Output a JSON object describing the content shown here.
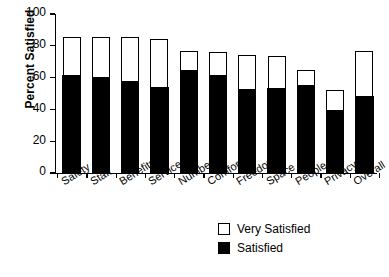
{
  "chart_data": {
    "type": "bar",
    "subtype": "stacked-vertical",
    "title": "",
    "xlabel": "",
    "ylabel": "Percent Satisfied",
    "ylim": [
      0,
      100
    ],
    "yticks": [
      0,
      20,
      40,
      60,
      80,
      100
    ],
    "ytick_labels": [
      "0",
      "20",
      "40",
      "60",
      "80",
      "100"
    ],
    "grid": false,
    "legend_position": "bottom-right",
    "categories": [
      "Safety",
      "Staff",
      "Benefits",
      "Services",
      "Numbers",
      "Comfort",
      "Freedom",
      "Space",
      "People",
      "Privacy",
      "Overall"
    ],
    "series": [
      {
        "name": "Satisfied",
        "color": "#000000",
        "values": [
          61.5,
          60.5,
          58.0,
          54.5,
          65.0,
          61.5,
          53.0,
          53.5,
          55.5,
          40.0,
          48.5
        ]
      },
      {
        "name": "Very Satisfied",
        "color": "#ffffff",
        "values": [
          24.0,
          25.0,
          27.5,
          30.0,
          12.0,
          14.5,
          21.0,
          20.0,
          9.0,
          12.0,
          28.0
        ]
      }
    ],
    "totals": [
      85.5,
      85.5,
      85.5,
      84.5,
      77.0,
      76.0,
      74.0,
      73.5,
      64.5,
      52.0,
      76.5
    ]
  },
  "legend": {
    "entries": [
      {
        "label": "Very Satisfied",
        "style": "open"
      },
      {
        "label": "Satisfied",
        "style": "filled"
      }
    ]
  },
  "colors": {
    "satisfied": "#000000",
    "very_satisfied": "#ffffff",
    "axis": "#000000",
    "background": "#ffffff"
  }
}
